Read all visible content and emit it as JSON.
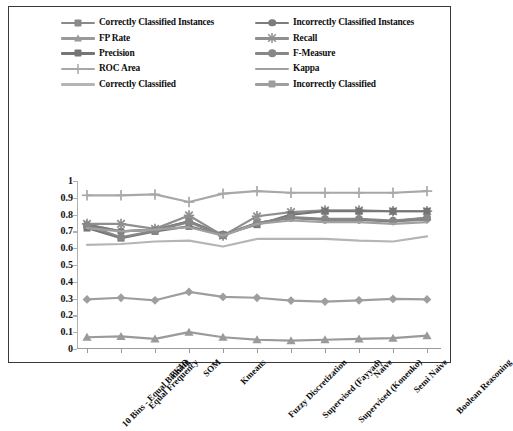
{
  "chart_data": {
    "type": "line",
    "title": "",
    "xlabel": "",
    "ylabel": "",
    "ylim": [
      0,
      1
    ],
    "ytick_step": 0.1,
    "grid": false,
    "legend_position": "top",
    "yticks": [
      "1",
      "0.9",
      "0.8",
      "0.7",
      "0.6",
      "0.5",
      "0.4",
      "0.3",
      "0.2",
      "0.1",
      "0"
    ],
    "categories": [
      "10 Bins - Equal Binning",
      "Equal Frequency",
      "PKID",
      "SOM",
      "Kmeans",
      "Fuzzy Discretization",
      "Supervised (Fayyad)",
      "Supervised (Konenko)",
      "Naive",
      "Semi Naive",
      "Boolean Reasoning"
    ],
    "series": [
      {
        "name": "Correctly Classified Instances",
        "marker": "diamond",
        "color": "#8a8a8a",
        "values": [
          0.74,
          0.7,
          0.71,
          0.76,
          0.68,
          0.75,
          0.78,
          0.77,
          0.77,
          0.76,
          0.77
        ]
      },
      {
        "name": "Incorrectly Classified Instances",
        "marker": "circle",
        "color": "#7c7c7c",
        "values": [
          0.74,
          0.7,
          0.71,
          0.76,
          0.68,
          0.75,
          0.78,
          0.77,
          0.77,
          0.76,
          0.78
        ]
      },
      {
        "name": "FP Rate",
        "marker": "triangle",
        "color": "#9a9a9a",
        "values": [
          0.07,
          0.075,
          0.06,
          0.1,
          0.07,
          0.055,
          0.05,
          0.055,
          0.06,
          0.065,
          0.08
        ]
      },
      {
        "name": "Recall",
        "marker": "star",
        "color": "#8f8f8f",
        "values": [
          0.745,
          0.745,
          0.715,
          0.795,
          0.675,
          0.79,
          0.815,
          0.825,
          0.825,
          0.82,
          0.82
        ]
      },
      {
        "name": "Precision",
        "marker": "square",
        "color": "#757575",
        "values": [
          0.72,
          0.66,
          0.7,
          0.73,
          0.68,
          0.74,
          0.8,
          0.82,
          0.82,
          0.82,
          0.82
        ]
      },
      {
        "name": "F-Measure",
        "marker": "circle",
        "color": "#878787",
        "values": [
          0.735,
          0.665,
          0.705,
          0.755,
          0.675,
          0.75,
          0.785,
          0.775,
          0.775,
          0.765,
          0.78
        ]
      },
      {
        "name": "ROC Area",
        "marker": "plus",
        "color": "#a8a8a8",
        "values": [
          0.915,
          0.915,
          0.92,
          0.875,
          0.925,
          0.94,
          0.93,
          0.93,
          0.93,
          0.93,
          0.94
        ]
      },
      {
        "name": "Kappa",
        "marker": "none",
        "color": "#a0a0a0",
        "values": [
          0.72,
          0.7,
          0.71,
          0.725,
          0.675,
          0.745,
          0.765,
          0.755,
          0.755,
          0.745,
          0.755
        ]
      },
      {
        "name": "Correctly Classified",
        "marker": "none",
        "color": "#b5b5b5",
        "values": [
          0.62,
          0.625,
          0.64,
          0.645,
          0.61,
          0.655,
          0.655,
          0.655,
          0.645,
          0.64,
          0.67
        ]
      },
      {
        "name": "Incorrectly Classified",
        "marker": "diamond",
        "color": "#9e9e9e",
        "values": [
          0.295,
          0.305,
          0.29,
          0.34,
          0.31,
          0.305,
          0.288,
          0.282,
          0.29,
          0.298,
          0.295
        ]
      }
    ]
  },
  "legend": {
    "entries": [
      {
        "label": "Correctly Classified Instances",
        "marker": "diamond",
        "color": "#8a8a8a"
      },
      {
        "label": "Incorrectly Classified Instances",
        "marker": "circle",
        "color": "#7c7c7c"
      },
      {
        "label": "FP Rate",
        "marker": "triangle",
        "color": "#9a9a9a"
      },
      {
        "label": "Recall",
        "marker": "star",
        "color": "#8f8f8f"
      },
      {
        "label": "Precision",
        "marker": "square",
        "color": "#757575"
      },
      {
        "label": "F-Measure",
        "marker": "circle",
        "color": "#878787"
      },
      {
        "label": "ROC Area",
        "marker": "plus",
        "color": "#a8a8a8"
      },
      {
        "label": "Kappa",
        "marker": "none",
        "color": "#a0a0a0"
      },
      {
        "label": "Correctly Classified",
        "marker": "none",
        "color": "#b5b5b5"
      },
      {
        "label": "Incorrectly Classified",
        "marker": "diamond",
        "color": "#9e9e9e"
      }
    ]
  }
}
